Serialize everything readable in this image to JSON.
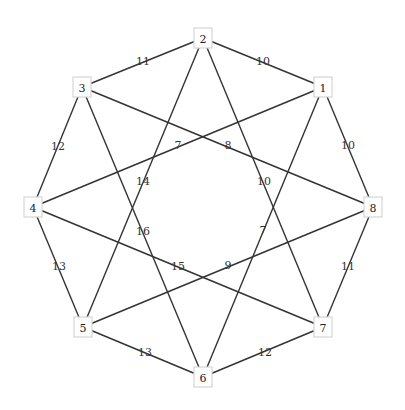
{
  "graph": {
    "type": "undirected-weighted",
    "colors": {
      "edge": "#333333",
      "node_border": "#d6d6d6",
      "node_fill": "#ffffff",
      "text": "#222222"
    },
    "nodes": [
      {
        "id": "1",
        "label": "1",
        "x": 323,
        "y": 87
      },
      {
        "id": "2",
        "label": "2",
        "x": 203,
        "y": 38
      },
      {
        "id": "3",
        "label": "3",
        "x": 82,
        "y": 87
      },
      {
        "id": "4",
        "label": "4",
        "x": 33,
        "y": 207
      },
      {
        "id": "5",
        "label": "5",
        "x": 83,
        "y": 327
      },
      {
        "id": "6",
        "label": "6",
        "x": 203,
        "y": 377
      },
      {
        "id": "7",
        "label": "7",
        "x": 323,
        "y": 327
      },
      {
        "id": "8",
        "label": "8",
        "x": 373,
        "y": 207
      }
    ],
    "edges": [
      {
        "from": "2",
        "to": "1",
        "weight": "10",
        "lx": 263,
        "ly": 61
      },
      {
        "from": "2",
        "to": "3",
        "weight": "11",
        "lx": 143,
        "ly": 61
      },
      {
        "from": "3",
        "to": "4",
        "weight": "12",
        "lx": 58,
        "ly": 146
      },
      {
        "from": "4",
        "to": "5",
        "weight": "13",
        "lx": 59,
        "ly": 266
      },
      {
        "from": "5",
        "to": "6",
        "weight": "13",
        "lx": 145,
        "ly": 352
      },
      {
        "from": "6",
        "to": "7",
        "weight": "12",
        "lx": 265,
        "ly": 352
      },
      {
        "from": "7",
        "to": "8",
        "weight": "11",
        "lx": 348,
        "ly": 266
      },
      {
        "from": "8",
        "to": "1",
        "weight": "10",
        "lx": 348,
        "ly": 145
      },
      {
        "from": "1",
        "to": "4",
        "weight": "7",
        "lx": 178,
        "ly": 145
      },
      {
        "from": "3",
        "to": "8",
        "weight": "8",
        "lx": 228,
        "ly": 145
      },
      {
        "from": "2",
        "to": "5",
        "weight": "14",
        "lx": 143,
        "ly": 181
      },
      {
        "from": "2",
        "to": "7",
        "weight": "10",
        "lx": 264,
        "ly": 181
      },
      {
        "from": "3",
        "to": "6",
        "weight": "16",
        "lx": 143,
        "ly": 231
      },
      {
        "from": "1",
        "to": "6",
        "weight": "7",
        "lx": 263,
        "ly": 230
      },
      {
        "from": "4",
        "to": "7",
        "weight": "15",
        "lx": 178,
        "ly": 266
      },
      {
        "from": "8",
        "to": "5",
        "weight": "9",
        "lx": 228,
        "ly": 265
      }
    ]
  }
}
